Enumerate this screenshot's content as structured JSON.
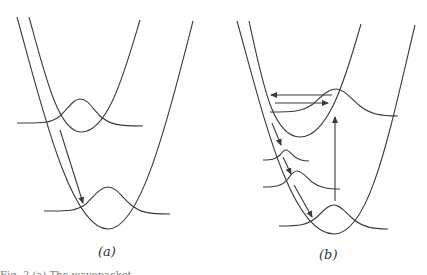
{
  "figure": {
    "panels": [
      {
        "id": "a",
        "label": "(a)",
        "potential_curves": 2,
        "wavepackets": 2,
        "arrows": 1
      },
      {
        "id": "b",
        "label": "(b)",
        "potential_curves": 2,
        "wavepackets": 4,
        "arrows": 6
      }
    ],
    "caption_partial": "Fig. 2   (a) The wavepacket ..."
  },
  "colors": {
    "line": "#3a3a3a",
    "background": "#ffffff"
  }
}
